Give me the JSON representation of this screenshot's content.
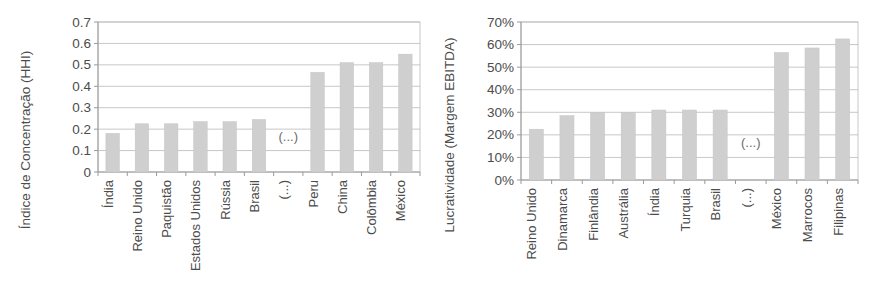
{
  "figure": {
    "background_color": "#ffffff",
    "bar_color": "#cfcfcf",
    "grid_color": "#b9b9b9",
    "axis_color": "#9a9a9a",
    "text_color": "#4c4c4c",
    "break_marker": "(...)"
  },
  "chart_data": [
    {
      "type": "bar",
      "id": "left",
      "title": "",
      "xlabel": "",
      "ylabel": "Índice de Concentração (HHI)",
      "ylim": [
        0,
        0.7
      ],
      "ytick_labels": [
        "0",
        "0.1",
        "0.2",
        "0.3",
        "0.4",
        "0.5",
        "0.6",
        "0.7"
      ],
      "ytick_values": [
        0,
        0.1,
        0.2,
        0.3,
        0.4,
        0.5,
        0.6,
        0.7
      ],
      "grid": true,
      "legend": "none",
      "categories": [
        "Índia",
        "Reino Unido",
        "Paquistão",
        "Estados Unidos",
        "Rússia",
        "Brasil",
        "(...)",
        "Peru",
        "China",
        "Colômbia",
        "México"
      ],
      "values": [
        0.18,
        0.225,
        0.225,
        0.235,
        0.235,
        0.245,
        null,
        0.465,
        0.51,
        0.51,
        0.55
      ]
    },
    {
      "type": "bar",
      "id": "right",
      "title": "",
      "xlabel": "",
      "ylabel": "Lucratividade (Margem EBITDA)",
      "ylim": [
        0,
        70
      ],
      "ytick_labels": [
        "0%",
        "10%",
        "20%",
        "30%",
        "40%",
        "50%",
        "60%",
        "70%"
      ],
      "ytick_values": [
        0,
        10,
        20,
        30,
        40,
        50,
        60,
        70
      ],
      "grid": true,
      "legend": "none",
      "categories": [
        "Reino Unido",
        "Dinamarca",
        "Finlândia",
        "Austrália",
        "Índia",
        "Turquia",
        "Brasil",
        "(...)",
        "México",
        "Marrocos",
        "Filipinas"
      ],
      "values": [
        22.5,
        28.5,
        30,
        30,
        31,
        31,
        31,
        null,
        56.5,
        58.5,
        62.5
      ]
    }
  ]
}
